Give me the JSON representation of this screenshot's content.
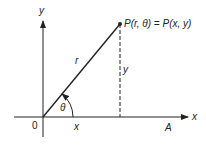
{
  "diagram": {
    "axes": {
      "x_label": "x",
      "y_label": "y",
      "origin_label": "0",
      "ray_label": "A"
    },
    "point": {
      "label": "P(r, θ) = P(x, y)"
    },
    "segments": {
      "radius_label": "r",
      "vertical_label": "y",
      "horizontal_label": "x"
    },
    "angle": {
      "label": "θ"
    },
    "colors": {
      "line": "#222222",
      "background": "#ffffff"
    }
  }
}
